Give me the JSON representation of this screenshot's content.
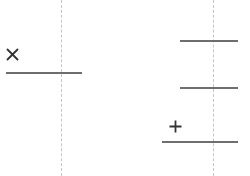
{
  "diagram": {
    "guides": [
      {
        "id": "left-guide",
        "x": 61
      },
      {
        "id": "right-guide",
        "x": 213
      }
    ],
    "segments": [
      {
        "id": "left-segment",
        "x1": 6,
        "x2": 82,
        "y": 73
      },
      {
        "id": "right-segment-top",
        "x1": 180,
        "x2": 238,
        "y": 41
      },
      {
        "id": "right-segment-middle",
        "x1": 180,
        "x2": 238,
        "y": 88
      },
      {
        "id": "right-segment-bottom",
        "x1": 162,
        "x2": 238,
        "y": 142
      }
    ],
    "markers": [
      {
        "id": "remove-marker",
        "icon": "close-icon",
        "symbol": "×",
        "x": 7,
        "y": 48
      },
      {
        "id": "add-marker",
        "icon": "plus-icon",
        "symbol": "+",
        "x": 169,
        "y": 120
      }
    ],
    "colors": {
      "line": "#6e6e6e",
      "guide": "#c4c4c4",
      "glyph": "#333333"
    }
  }
}
